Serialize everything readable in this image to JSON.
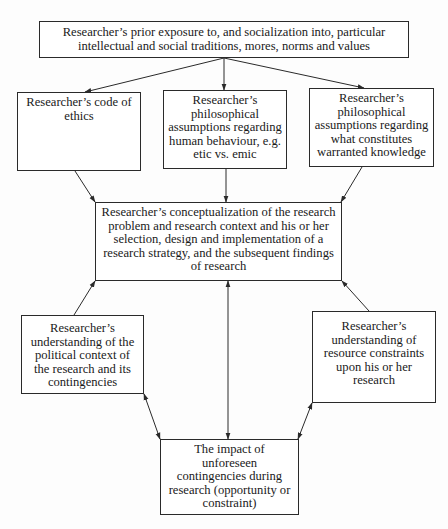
{
  "diagram": {
    "type": "flowchart",
    "nodes": {
      "top": {
        "lines": [
          "Researcher’s prior exposure to, and socialization into, particular",
          "intellectual and social traditions, mores, norms and values"
        ]
      },
      "ethics": {
        "lines": [
          "Researcher’s code of",
          "ethics"
        ]
      },
      "human": {
        "lines": [
          "Researcher’s",
          "philosophical",
          "assumptions regarding",
          "human behaviour, e.g.",
          "etic vs. emic"
        ]
      },
      "knowledge": {
        "lines": [
          "Researcher’s",
          "philosophical",
          "assumptions regarding",
          "what constitutes",
          "warranted knowledge"
        ]
      },
      "center": {
        "lines": [
          "Researcher’s conceptualization of the research",
          "problem and research context and his or her",
          "selection, design and implementation of a",
          "research strategy, and the subsequent findings",
          "of research"
        ]
      },
      "political": {
        "lines": [
          "Researcher’s",
          "understanding of the",
          "political context of",
          "the research and its",
          "contingencies"
        ]
      },
      "resource": {
        "lines": [
          "Researcher’s",
          "understanding of",
          "resource constraints",
          "upon his or her",
          "research"
        ]
      },
      "impact": {
        "lines": [
          "The impact of",
          "unforeseen",
          "contingencies during",
          "research (opportunity or",
          "constraint)"
        ]
      }
    },
    "edges": [
      {
        "from": "top",
        "to": "ethics",
        "direction": "forward"
      },
      {
        "from": "top",
        "to": "human",
        "direction": "forward"
      },
      {
        "from": "top",
        "to": "knowledge",
        "direction": "forward"
      },
      {
        "from": "ethics",
        "to": "center",
        "direction": "forward"
      },
      {
        "from": "human",
        "to": "center",
        "direction": "forward"
      },
      {
        "from": "knowledge",
        "to": "center",
        "direction": "forward"
      },
      {
        "from": "political",
        "to": "center",
        "direction": "forward"
      },
      {
        "from": "resource",
        "to": "center",
        "direction": "forward"
      },
      {
        "from": "center",
        "to": "impact",
        "direction": "both"
      },
      {
        "from": "political",
        "to": "impact",
        "direction": "both"
      },
      {
        "from": "resource",
        "to": "impact",
        "direction": "both"
      }
    ],
    "colors": {
      "line": "#2a2a2a",
      "box_border": "#2a2a2a",
      "background": "#ffffff",
      "text": "#1a1a1a"
    }
  }
}
